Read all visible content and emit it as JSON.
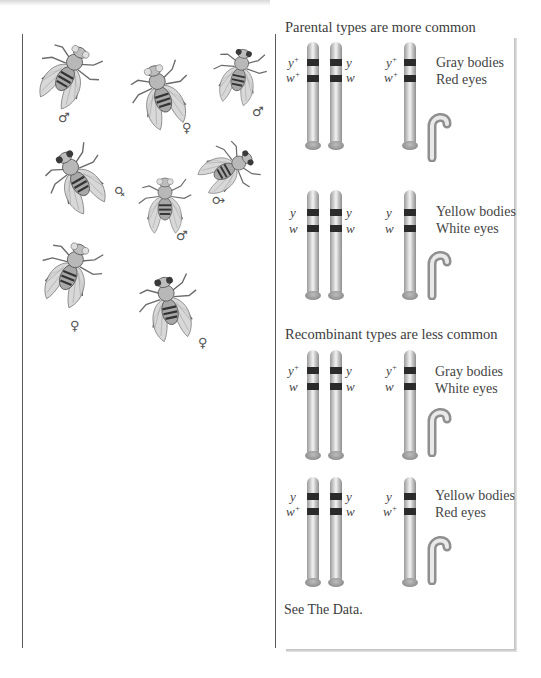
{
  "header": {
    "title_fragment": ""
  },
  "flies": [
    {
      "id": 1,
      "sex": "male",
      "symbol": "♂",
      "body": "gray",
      "eyes": "red"
    },
    {
      "id": 2,
      "sex": "female",
      "symbol": "♀",
      "body": "gray",
      "eyes": "red"
    },
    {
      "id": 3,
      "sex": "male",
      "symbol": "♂",
      "body": "gray",
      "eyes": "red"
    },
    {
      "id": 4,
      "sex": "female",
      "symbol": "♀",
      "body": "gray",
      "eyes": "red"
    },
    {
      "id": 5,
      "sex": "male",
      "symbol": "♂",
      "body": "gray",
      "eyes": "white"
    },
    {
      "id": 6,
      "sex": "male",
      "symbol": "♂",
      "body": "gray",
      "eyes": "red"
    },
    {
      "id": 7,
      "sex": "female",
      "symbol": "♀",
      "body": "gray",
      "eyes": "white"
    },
    {
      "id": 8,
      "sex": "female",
      "symbol": "♀",
      "body": "gray",
      "eyes": "red"
    }
  ],
  "sections": [
    {
      "title": "Parental types are more common",
      "groups": [
        {
          "female_left": {
            "top": "y",
            "top_sup": "+",
            "bottom": "w",
            "bottom_sup": "+"
          },
          "female_right": {
            "top": "y",
            "top_sup": "",
            "bottom": "w",
            "bottom_sup": ""
          },
          "male_x": {
            "top": "y",
            "top_sup": "+",
            "bottom": "w",
            "bottom_sup": "+"
          },
          "phenotype": [
            "Gray bodies",
            "Red eyes"
          ]
        },
        {
          "female_left": {
            "top": "y",
            "top_sup": "",
            "bottom": "w",
            "bottom_sup": ""
          },
          "female_right": {
            "top": "y",
            "top_sup": "",
            "bottom": "w",
            "bottom_sup": ""
          },
          "male_x": {
            "top": "y",
            "top_sup": "",
            "bottom": "w",
            "bottom_sup": ""
          },
          "phenotype": [
            "Yellow bodies",
            "White eyes"
          ]
        }
      ]
    },
    {
      "title": "Recombinant types are less common",
      "groups": [
        {
          "female_left": {
            "top": "y",
            "top_sup": "+",
            "bottom": "w",
            "bottom_sup": ""
          },
          "female_right": {
            "top": "y",
            "top_sup": "",
            "bottom": "w",
            "bottom_sup": ""
          },
          "male_x": {
            "top": "y",
            "top_sup": "+",
            "bottom": "w",
            "bottom_sup": ""
          },
          "phenotype": [
            "Gray bodies",
            "White eyes"
          ]
        },
        {
          "female_left": {
            "top": "y",
            "top_sup": "",
            "bottom": "w",
            "bottom_sup": "+"
          },
          "female_right": {
            "top": "y",
            "top_sup": "",
            "bottom": "w",
            "bottom_sup": ""
          },
          "male_x": {
            "top": "y",
            "top_sup": "",
            "bottom": "w",
            "bottom_sup": "+"
          },
          "phenotype": [
            "Yellow bodies",
            "Red eyes"
          ]
        }
      ]
    }
  ],
  "footer": {
    "link_text": "See The Data."
  }
}
